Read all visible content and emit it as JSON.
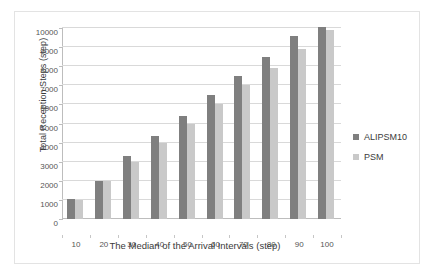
{
  "chart_data": {
    "type": "bar",
    "title": "",
    "xlabel": "The Median of the Arrival Intervals (step)",
    "ylabel": "Total Reception Steps (step)",
    "categories": [
      "10",
      "20",
      "30",
      "40",
      "50",
      "60",
      "70",
      "80",
      "90",
      "100"
    ],
    "series": [
      {
        "name": "ALIPSM10",
        "color": "#7f7f7f",
        "values": [
          1050,
          2000,
          3280,
          4330,
          5400,
          6500,
          7480,
          8480,
          9570,
          10030
        ]
      },
      {
        "name": "PSM",
        "color": "#c9c9c9",
        "values": [
          1000,
          2000,
          3000,
          4000,
          5000,
          6000,
          7000,
          7920,
          8920,
          9880
        ]
      }
    ],
    "ylim": [
      0,
      10000
    ],
    "ytick_values": [
      0,
      1000,
      2000,
      3000,
      4000,
      5000,
      6000,
      7000,
      8000,
      9000,
      10000
    ],
    "ytick_labels": [
      "0",
      "1000",
      "2000",
      "3000",
      "4000",
      "5000",
      "6000",
      "7000",
      "8000",
      "9000",
      "10000"
    ],
    "grid": "horizontal",
    "legend_position": "right",
    "legend": [
      "ALIPSM10",
      "PSM"
    ]
  }
}
